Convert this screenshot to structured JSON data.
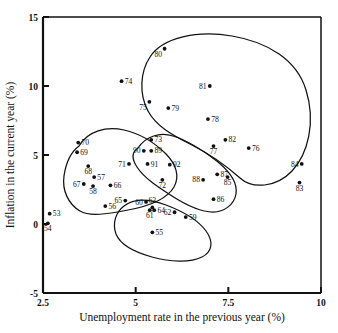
{
  "chart_data": {
    "type": "scatter",
    "title": "",
    "xlabel": "Unemployment rate in the previous year (%)",
    "ylabel": "Inflation in the current year (%)",
    "xlim": [
      2.5,
      10
    ],
    "ylim": [
      -5,
      15
    ],
    "xticks": [
      "2.5",
      "5",
      "7.5",
      "10"
    ],
    "xtick_values": [
      2.5,
      5,
      7.5,
      10
    ],
    "yticks": [
      "15",
      "10",
      "5",
      "0",
      "-5"
    ],
    "ytick_values": [
      15,
      10,
      5,
      0,
      -5
    ],
    "grid": false,
    "legend": "none",
    "point_label_note": "Each point is labelled with the two-digit year",
    "points": [
      {
        "label": "53",
        "x": 2.68,
        "y": 0.75
      },
      {
        "label": "54",
        "x": 2.63,
        "y": 0.05
      },
      {
        "label": "55",
        "x": 5.45,
        "y": -0.6
      },
      {
        "label": "56",
        "x": 4.18,
        "y": 1.3
      },
      {
        "label": "57",
        "x": 3.88,
        "y": 3.4
      },
      {
        "label": "58",
        "x": 3.85,
        "y": 2.75
      },
      {
        "label": "59",
        "x": 6.35,
        "y": 0.5
      },
      {
        "label": "60",
        "x": 5.28,
        "y": 1.6
      },
      {
        "label": "61",
        "x": 5.38,
        "y": 1.0
      },
      {
        "label": "62",
        "x": 6.05,
        "y": 0.85
      },
      {
        "label": "63",
        "x": 5.45,
        "y": 1.2
      },
      {
        "label": "64",
        "x": 5.5,
        "y": 1.0
      },
      {
        "label": "65",
        "x": 4.72,
        "y": 1.7
      },
      {
        "label": "66",
        "x": 4.32,
        "y": 2.8
      },
      {
        "label": "67",
        "x": 3.6,
        "y": 2.9
      },
      {
        "label": "68",
        "x": 3.72,
        "y": 4.2
      },
      {
        "label": "69",
        "x": 3.42,
        "y": 5.2
      },
      {
        "label": "70",
        "x": 3.45,
        "y": 5.9
      },
      {
        "label": "71",
        "x": 4.82,
        "y": 4.35
      },
      {
        "label": "72",
        "x": 5.72,
        "y": 3.2
      },
      {
        "label": "73",
        "x": 5.42,
        "y": 6.1
      },
      {
        "label": "74",
        "x": 4.62,
        "y": 10.35
      },
      {
        "label": "75",
        "x": 5.37,
        "y": 8.85
      },
      {
        "label": "76",
        "x": 8.05,
        "y": 5.5
      },
      {
        "label": "77",
        "x": 7.1,
        "y": 5.65
      },
      {
        "label": "78",
        "x": 6.95,
        "y": 7.6
      },
      {
        "label": "79",
        "x": 5.88,
        "y": 8.4
      },
      {
        "label": "80",
        "x": 5.78,
        "y": 12.7
      },
      {
        "label": "81",
        "x": 7.0,
        "y": 10.0
      },
      {
        "label": "82",
        "x": 7.42,
        "y": 6.1
      },
      {
        "label": "83",
        "x": 9.42,
        "y": 3.0
      },
      {
        "label": "84",
        "x": 9.48,
        "y": 4.35
      },
      {
        "label": "85",
        "x": 7.48,
        "y": 3.4
      },
      {
        "label": "86",
        "x": 7.1,
        "y": 1.8
      },
      {
        "label": "87",
        "x": 7.2,
        "y": 3.6
      },
      {
        "label": "88",
        "x": 6.82,
        "y": 3.2
      },
      {
        "label": "89",
        "x": 5.42,
        "y": 5.3
      },
      {
        "label": "90",
        "x": 5.22,
        "y": 5.3
      },
      {
        "label": "91",
        "x": 5.32,
        "y": 4.35
      },
      {
        "label": "92",
        "x": 5.92,
        "y": 4.3
      }
    ],
    "clusters": [
      {
        "name": "upper-right-cluster",
        "members": [
          "74",
          "75",
          "76",
          "77",
          "78",
          "79",
          "80",
          "81",
          "82",
          "83",
          "84"
        ]
      },
      {
        "name": "left-cluster",
        "members": [
          "55",
          "56",
          "57",
          "58",
          "60",
          "61",
          "63",
          "64",
          "65",
          "66",
          "67",
          "68",
          "69",
          "70",
          "71"
        ]
      },
      {
        "name": "middle-cluster",
        "members": [
          "72",
          "73",
          "85",
          "86",
          "87",
          "88",
          "89",
          "90",
          "91",
          "92"
        ]
      },
      {
        "name": "bottom-cluster",
        "members": [
          "59",
          "62"
        ]
      }
    ]
  }
}
